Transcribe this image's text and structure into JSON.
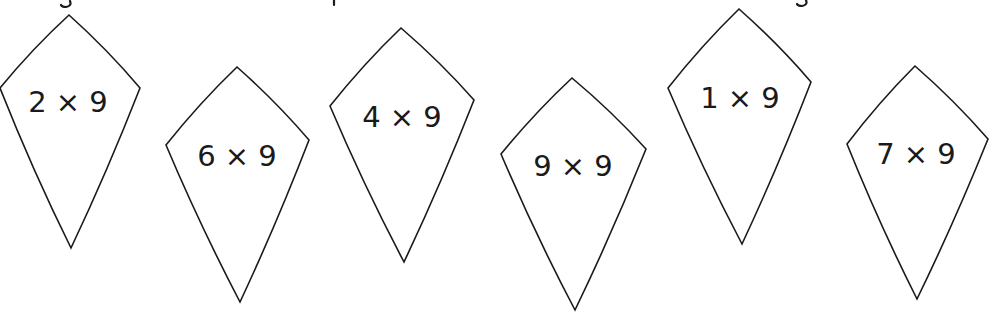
{
  "worksheet": {
    "header_text_visible": false,
    "kites": [
      {
        "label": "2 × 9",
        "top": [
          69,
          15
        ],
        "left": [
          0,
          88
        ],
        "right": [
          140,
          88
        ],
        "bottom": [
          71,
          248
        ],
        "text_x": 68,
        "text_y": 112
      },
      {
        "label": "6 × 9",
        "top": [
          237,
          67
        ],
        "left": [
          166,
          145
        ],
        "right": [
          309,
          140
        ],
        "bottom": [
          240,
          302
        ],
        "text_x": 237,
        "text_y": 166
      },
      {
        "label": "4 × 9",
        "top": [
          401,
          28
        ],
        "left": [
          330,
          106
        ],
        "right": [
          474,
          100
        ],
        "bottom": [
          404,
          262
        ],
        "text_x": 402,
        "text_y": 127
      },
      {
        "label": "9 × 9",
        "top": [
          572,
          78
        ],
        "left": [
          501,
          154
        ],
        "right": [
          646,
          149
        ],
        "bottom": [
          575,
          310
        ],
        "text_x": 573,
        "text_y": 176
      },
      {
        "label": "1 × 9",
        "top": [
          739,
          9
        ],
        "left": [
          668,
          88
        ],
        "right": [
          811,
          82
        ],
        "bottom": [
          742,
          244
        ],
        "text_x": 740,
        "text_y": 108
      },
      {
        "label": "7 × 9",
        "top": [
          915,
          66
        ],
        "left": [
          847,
          144
        ],
        "right": [
          988,
          139
        ],
        "bottom": [
          917,
          299
        ],
        "text_x": 916,
        "text_y": 164
      }
    ]
  }
}
